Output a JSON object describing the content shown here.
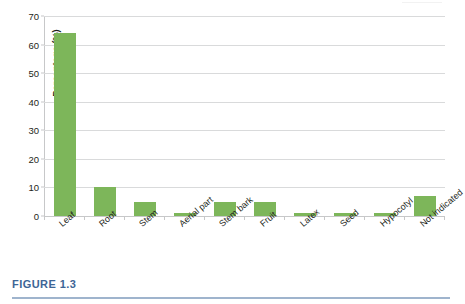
{
  "figure": {
    "caption": "FIGURE 1.3",
    "caption_color": "#3d6596"
  },
  "chart_data": {
    "type": "bar",
    "title": "",
    "xlabel": "",
    "ylabel": "Percentage (%)",
    "ylim": [
      0,
      70
    ],
    "yticks": [
      0,
      10,
      20,
      30,
      40,
      50,
      60,
      70
    ],
    "ytick_labels": [
      "0",
      "10",
      "20",
      "30",
      "40",
      "50",
      "60",
      "70"
    ],
    "grid": true,
    "legend": false,
    "bar_color": "#7db65a",
    "categories": [
      "Leaf",
      "Root",
      "Stem",
      "Aerial part",
      "Stem bark",
      "Fruit",
      "Latex",
      "Seed",
      "Hypocotyl",
      "Not indicated"
    ],
    "values": [
      64,
      10,
      5,
      1,
      5,
      5,
      1,
      1,
      1,
      7
    ]
  }
}
